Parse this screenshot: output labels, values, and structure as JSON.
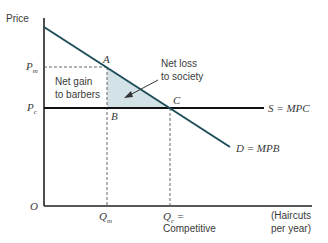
{
  "diagram": {
    "y_axis_label": "Price",
    "x_axis_label_line1": "(Haircuts",
    "x_axis_label_line2": "per year)",
    "origin_label": "O",
    "price_labels": {
      "monopoly": "P",
      "monopoly_sub": "m",
      "competitive": "P",
      "competitive_sub": "c"
    },
    "quantity_labels": {
      "monopoly": "Q",
      "monopoly_sub": "m",
      "competitive": "Q",
      "competitive_sub": "c",
      "competitive_suffix": " =",
      "competitive_note": "Competitive"
    },
    "points": {
      "A": "A",
      "B": "B",
      "C": "C"
    },
    "curves": {
      "supply": "S = MPC",
      "demand": "D = MPB"
    },
    "annotations": {
      "net_gain_line1": "Net gain",
      "net_gain_line2": "to barbers",
      "net_loss_line1": "Net loss",
      "net_loss_line2": "to society"
    },
    "colors": {
      "demand": "#1f4e5a",
      "supply": "#111111",
      "axes": "#222222",
      "shade": "#d3e2e7",
      "dashed": "#666666"
    }
  }
}
